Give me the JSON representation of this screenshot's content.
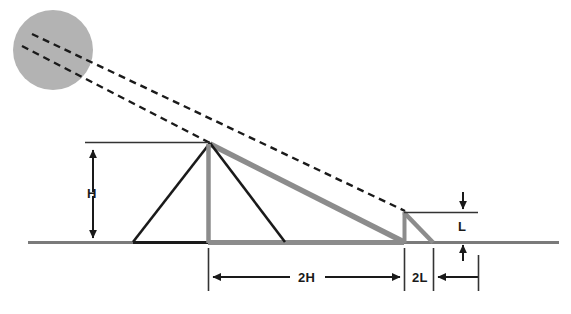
{
  "figure": {
    "background": "#ffffff"
  },
  "colors": {
    "sun_fill": "#b3b3b3",
    "dark_stroke": "#1a1a1a",
    "mid_stroke": "#333333",
    "gray_shadow": "#8c8c8c",
    "ground": "#7a7a7a",
    "label_text": "#1a1a1a"
  },
  "labels": {
    "height": "H",
    "base_span": "2H",
    "stick_shadow_span": "2L",
    "stick_height": "L"
  },
  "icons": {
    "sun": "sun-circle-icon",
    "ray_upper": "dashed-ray-icon",
    "ray_lower": "dashed-ray-icon",
    "arrow_up": "arrow-up-icon",
    "arrow_down": "arrow-down-icon",
    "arrow_left": "arrow-left-icon",
    "arrow_right": "arrow-right-icon"
  },
  "geometry": {
    "sun": {
      "cx": 53,
      "cy": 50,
      "r": 40
    },
    "ground": {
      "x1": 28,
      "x2": 559,
      "y": 242
    },
    "pyramid": {
      "apex_x": 210,
      "apex_y": 143,
      "base_left_x": 133,
      "base_right_x": 285,
      "base_y": 242,
      "center_x": 208
    },
    "pyramid_shadow": {
      "x1": 210,
      "y1": 143,
      "x2": 404,
      "y2": 242
    },
    "stick": {
      "x": 404,
      "top_y": 212,
      "base_y": 242
    },
    "stick_shadow": {
      "x1": 404,
      "y1": 212,
      "x2": 433,
      "y2": 242
    },
    "rays": [
      {
        "name": "ray-to-apex",
        "x1": 26,
        "y1": 48,
        "x2": 210,
        "y2": 143
      },
      {
        "name": "ray-to-stick-top",
        "x1": 34,
        "y1": 36,
        "x2": 404,
        "y2": 212
      }
    ],
    "dimensions": {
      "H": {
        "x": 93,
        "top_y": 148,
        "bottom_y": 242,
        "ref_line": {
          "x1": 85,
          "x2": 210,
          "y": 142
        }
      },
      "2H": {
        "y": 277,
        "x1": 208,
        "x2": 404,
        "ext_top_y": 248,
        "ext_bot_y": 290
      },
      "2L": {
        "y": 277,
        "x1": 404,
        "x2": 433,
        "arrow_from_x": 478,
        "ext_top_y": 248,
        "ext_bot_y": 290
      },
      "L": {
        "x": 463,
        "top_y": 196,
        "mid_top_y": 212,
        "mid_bot_y": 242,
        "bot_y": 258,
        "ref_line": {
          "x1": 404,
          "x2": 478,
          "y": 212
        }
      }
    }
  }
}
